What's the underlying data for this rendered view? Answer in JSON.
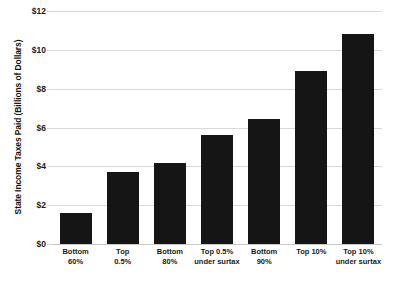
{
  "chart_data": {
    "type": "bar",
    "title": "",
    "xlabel": "",
    "ylabel": "State Income Taxes Paid (Billions of Dollars)",
    "categories": [
      "Bottom 60%",
      "Top 0.5%",
      "Bottom 80%",
      "Top 0.5% under surtax",
      "Bottom 90%",
      "Top 10%",
      "Top 10% under surtax"
    ],
    "category_lines": [
      [
        "Bottom",
        "60%"
      ],
      [
        "Top",
        "0.5%"
      ],
      [
        "Bottom",
        "80%"
      ],
      [
        "Top 0.5%",
        "under surtax"
      ],
      [
        "Bottom",
        "90%"
      ],
      [
        "Top 10%",
        ""
      ],
      [
        "Top 10%",
        "under surtax"
      ]
    ],
    "values": [
      1.6,
      3.7,
      4.15,
      5.6,
      6.45,
      8.9,
      10.8
    ],
    "ylim": [
      0,
      12
    ],
    "ytick_values": [
      0,
      2,
      4,
      6,
      8,
      10,
      12
    ],
    "ytick_labels": [
      "$0",
      "$2",
      "$4",
      "$6",
      "$8",
      "$10",
      "$12"
    ],
    "grid": true,
    "legend": "none",
    "bar_color": "#151515",
    "grid_color": "#d9d9d9",
    "background_color": "#ffffff"
  },
  "axes": {
    "y_title": "State Income Taxes Paid (Billions of Dollars)"
  },
  "title_sliver": {
    "text": ""
  }
}
